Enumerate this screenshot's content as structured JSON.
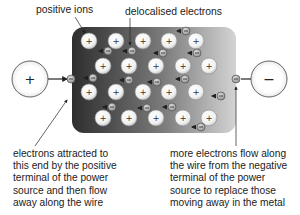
{
  "labels": {
    "positive_ions": "positive ions",
    "delocalised_electrons": "delocalised electrons",
    "left_caption": [
      "electrons attracted to",
      "this end by the positive",
      "terminal of the power",
      "source and then flow",
      "away along the wire"
    ],
    "right_caption": [
      "more electrons flow along",
      "the wire from the negative",
      "terminal of the power",
      "source to replace those",
      "moving away in the metal"
    ]
  },
  "terminals": {
    "positive": {
      "symbol": "+",
      "cx": 30,
      "cy": 79,
      "r": 18
    },
    "negative": {
      "symbol": "−",
      "cx": 269,
      "cy": 79,
      "r": 18
    }
  },
  "metal_block": {
    "x": 72,
    "y": 27,
    "width": 164,
    "height": 106,
    "radius": 12,
    "gradient_dark": "#2e2e2e",
    "gradient_light": "#d4d4d4"
  },
  "ion_symbol": "+",
  "electron_symbol": "−",
  "ions": [
    {
      "x": 89,
      "y": 41
    },
    {
      "x": 116,
      "y": 41
    },
    {
      "x": 143,
      "y": 41
    },
    {
      "x": 169,
      "y": 41
    },
    {
      "x": 196,
      "y": 41
    },
    {
      "x": 103,
      "y": 66
    },
    {
      "x": 129,
      "y": 66
    },
    {
      "x": 156,
      "y": 66
    },
    {
      "x": 183,
      "y": 66
    },
    {
      "x": 209,
      "y": 66
    },
    {
      "x": 89,
      "y": 92
    },
    {
      "x": 116,
      "y": 92
    },
    {
      "x": 143,
      "y": 92
    },
    {
      "x": 169,
      "y": 92
    },
    {
      "x": 196,
      "y": 92
    },
    {
      "x": 103,
      "y": 118
    },
    {
      "x": 129,
      "y": 118
    },
    {
      "x": 156,
      "y": 118
    },
    {
      "x": 183,
      "y": 118
    },
    {
      "x": 209,
      "y": 118
    }
  ],
  "electrons": [
    {
      "x": 108,
      "y": 51
    },
    {
      "x": 132,
      "y": 51
    },
    {
      "x": 186,
      "y": 31
    },
    {
      "x": 163,
      "y": 53
    },
    {
      "x": 197,
      "y": 53
    },
    {
      "x": 93,
      "y": 78
    },
    {
      "x": 129,
      "y": 80
    },
    {
      "x": 157,
      "y": 82
    },
    {
      "x": 185,
      "y": 79
    },
    {
      "x": 221,
      "y": 96
    },
    {
      "x": 112,
      "y": 107
    },
    {
      "x": 147,
      "y": 108
    },
    {
      "x": 172,
      "y": 107
    },
    {
      "x": 201,
      "y": 127
    }
  ],
  "wire_electrons": [
    {
      "x": 71,
      "y": 79
    },
    {
      "x": 236,
      "y": 79
    }
  ],
  "colors": {
    "ion_fill": "#f4f4f4",
    "ion_stroke": "#8a8a8a",
    "electron_fill": "#b8b8b8",
    "electron_stroke": "#444444",
    "wire": "#222222",
    "terminal_stroke": "#555555",
    "text": "#222222"
  }
}
